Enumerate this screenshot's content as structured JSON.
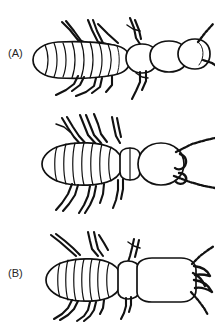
{
  "figure": {
    "background_color": "#ffffff",
    "ink_color": "#111111",
    "label_color": "#262626",
    "style": "black ink line drawing, dorsal view"
  },
  "panels": [
    {
      "id": "a",
      "label": "(A)",
      "label_text": "(A)",
      "name": "panel-a",
      "view": "oblique dorso-lateral",
      "description": "Elongate insect with strongly ribbed tapering abdomen, small rounded head, one pair of long beaded antennae directed to the right, six legs",
      "abdomen_segments": 10,
      "antennae_count": 2,
      "legs_count": 6,
      "orientation": "head to the right"
    },
    {
      "id": "b",
      "label": "(B)",
      "label_text": "(B)",
      "name": "panel-b",
      "view": "dorsal",
      "description": "Insect with oval segmented abdomen, narrow thorax, rounded head bearing short mandibles and a pair of long beaded antennae spread in a V, six legs",
      "abdomen_segments": 8,
      "antennae_count": 2,
      "legs_count": 6,
      "orientation": "head to the right"
    },
    {
      "id": "c",
      "label": "(C)",
      "label_text": "(C)",
      "name": "panel-c",
      "view": "dorsal",
      "description": "Insect with segmented abdomen and a very large rectangular head bearing long curved mandibles and short beaded antennae, six legs",
      "abdomen_segments": 8,
      "antennae_count": 2,
      "legs_count": 6,
      "orientation": "head to the right"
    }
  ]
}
